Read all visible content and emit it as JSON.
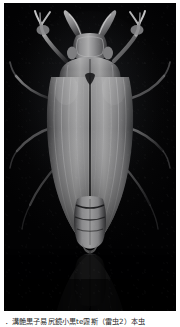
{
  "figure": {
    "kind": "photograph",
    "background_color": "#000000",
    "page_background": "#ffffff",
    "subject_color": "#8d8d8d",
    "caption": "．溝艶黒子易尻鏡小黒te霧斯（雷虫2）本虫"
  },
  "photo": {
    "alt_label": "dark dorsal photograph of a beetle on black background with reflection"
  }
}
